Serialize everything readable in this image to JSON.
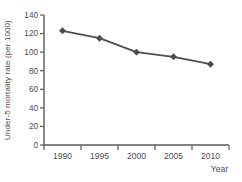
{
  "chart_data": {
    "type": "line",
    "title": "",
    "categories": [
      "1990",
      "1995",
      "2000",
      "2005",
      "2010"
    ],
    "series": [
      {
        "name": "Under-5 mortality rate",
        "values": [
          123,
          115,
          100,
          95,
          87
        ]
      }
    ],
    "xlabel": "Year",
    "ylabel": "Under-5 mortality rate (per 1000)",
    "ylim": [
      0,
      140
    ],
    "yticks": [
      0,
      20,
      40,
      60,
      80,
      100,
      120,
      140
    ],
    "grid": false,
    "legend_position": "none",
    "marker": "diamond",
    "colors": {
      "line": "#4f4f4f",
      "marker": "#4a4a4a",
      "axis": "#5a5a5a",
      "tick_text": "#4d4d4d",
      "background": "#ffffff"
    }
  }
}
